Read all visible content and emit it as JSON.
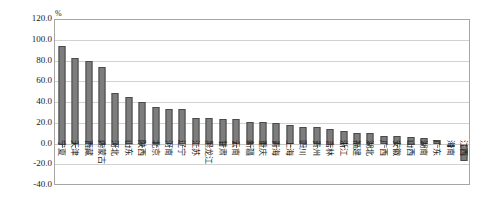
{
  "chart_data": {
    "type": "bar",
    "title": "",
    "subtitle": "",
    "xlabel": "",
    "ylabel": "",
    "unit_label": "%",
    "ylim": [
      -40.0,
      120.0
    ],
    "ytick_step": 20.0,
    "grid": true,
    "legend": "none",
    "bar_color": "#7d7d7d",
    "bar_edge_color": "#4a4a4a",
    "categories": [
      "宁夏",
      "天津",
      "西藏",
      "内蒙古",
      "河北",
      "山东",
      "陕西",
      "北京",
      "河南",
      "辽宁",
      "江苏",
      "黑龙江",
      "甘肃",
      "云南",
      "新疆",
      "重庆",
      "青海",
      "上海",
      "四川",
      "贵州",
      "吉林",
      "浙江",
      "福建",
      "湖北",
      "广西",
      "安徽",
      "山西",
      "湖南",
      "广东",
      "海南",
      "江西"
    ],
    "values": [
      95.0,
      83.0,
      80.5,
      75.0,
      50.0,
      46.0,
      41.0,
      36.0,
      34.5,
      34.0,
      26.0,
      25.5,
      25.0,
      24.5,
      22.0,
      21.5,
      20.5,
      19.0,
      17.0,
      16.5,
      15.0,
      13.0,
      11.5,
      11.0,
      8.5,
      8.0,
      7.5,
      6.0,
      4.0,
      -1.5,
      -16.0
    ],
    "ytick_labels": [
      "120.0",
      "100.0",
      "80.0",
      "60.0",
      "40.0",
      "20.0",
      "0.0",
      "-20.0",
      "-40.0"
    ],
    "ytick_values": [
      120.0,
      100.0,
      80.0,
      60.0,
      40.0,
      20.0,
      0.0,
      -20.0,
      -40.0
    ]
  }
}
